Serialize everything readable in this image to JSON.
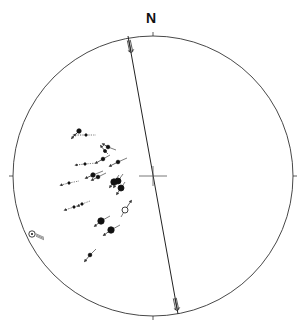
{
  "diagram": {
    "type": "stereonet",
    "north_label": "N",
    "center": [
      153,
      176
    ],
    "radius": 140,
    "colors": {
      "line": "#333333",
      "marker": "#111111",
      "arrow": "#555555",
      "background": "#ffffff"
    },
    "great_circle": {
      "from": [
        128,
        36
      ],
      "to": [
        178,
        314
      ]
    },
    "center_cross": {
      "half_width": 14,
      "half_height": 10
    },
    "fault_sense_markers": [
      {
        "x": 130,
        "y": 46,
        "angle": 78
      },
      {
        "x": 176,
        "y": 304,
        "angle": 78
      }
    ],
    "striae": [
      {
        "x": 79,
        "y": 131,
        "r": 2.2,
        "filled": true,
        "dx": -7,
        "dy": 7,
        "tail": [
          -6,
          6
        ],
        "dotted": false
      },
      {
        "x": 86,
        "y": 135,
        "r": 1.2,
        "filled": true,
        "dx": -12,
        "dy": 0,
        "tail": [
          10,
          0
        ],
        "dotted": true
      },
      {
        "x": 108,
        "y": 147,
        "r": 1.8,
        "filled": true,
        "dx": -5,
        "dy": -3,
        "tail": [
          8,
          3
        ],
        "dotted": false
      },
      {
        "x": 105,
        "y": 151,
        "r": 1.5,
        "filled": true,
        "dx": -4,
        "dy": -5,
        "tail": [
          3,
          3
        ],
        "dotted": false
      },
      {
        "x": 103,
        "y": 159,
        "r": 1.8,
        "filled": true,
        "dx": -7,
        "dy": 4,
        "tail": [
          7,
          -4
        ],
        "dotted": false
      },
      {
        "x": 118,
        "y": 162,
        "r": 1.8,
        "filled": true,
        "dx": -8,
        "dy": 4,
        "tail": [
          9,
          -4
        ],
        "dotted": false
      },
      {
        "x": 85,
        "y": 164,
        "r": 1.2,
        "filled": true,
        "dx": -9,
        "dy": 1,
        "tail": [
          12,
          -1
        ],
        "dotted": true
      },
      {
        "x": 93,
        "y": 175,
        "r": 2.2,
        "filled": true,
        "dx": -7,
        "dy": 3,
        "tail": [
          10,
          -4
        ],
        "dotted": false
      },
      {
        "x": 98,
        "y": 177,
        "r": 1.8,
        "filled": true,
        "dx": -6,
        "dy": 3,
        "tail": [
          8,
          -4
        ],
        "dotted": false
      },
      {
        "x": 114,
        "y": 182,
        "r": 3.2,
        "filled": true,
        "dx": -4,
        "dy": 5,
        "tail": [
          5,
          -7
        ],
        "dotted": false
      },
      {
        "x": 118,
        "y": 181,
        "r": 3.0,
        "filled": true,
        "dx": -4,
        "dy": 6,
        "tail": [
          5,
          -7
        ],
        "dotted": false
      },
      {
        "x": 121,
        "y": 188,
        "r": 3.0,
        "filled": true,
        "dx": -4,
        "dy": 6,
        "tail": [
          4,
          -6
        ],
        "dotted": false
      },
      {
        "x": 69,
        "y": 183,
        "r": 1.2,
        "filled": true,
        "dx": -8,
        "dy": 2,
        "tail": [
          10,
          -2
        ],
        "dotted": true
      },
      {
        "x": 74,
        "y": 207,
        "r": 1.2,
        "filled": true,
        "dx": -9,
        "dy": 3,
        "tail": [
          8,
          -3
        ],
        "dotted": true
      },
      {
        "x": 82,
        "y": 204,
        "r": 1.2,
        "filled": true,
        "dx": -4,
        "dy": 2,
        "tail": [
          8,
          -3
        ],
        "dotted": true
      },
      {
        "x": 125,
        "y": 210,
        "r": 3.0,
        "filled": false,
        "dx": 6,
        "dy": -9,
        "tail": [
          -4,
          7
        ],
        "dotted": false
      },
      {
        "x": 101,
        "y": 221,
        "r": 3.2,
        "filled": true,
        "dx": -6,
        "dy": 5,
        "tail": [
          9,
          -5
        ],
        "dotted": false
      },
      {
        "x": 111,
        "y": 230,
        "r": 3.2,
        "filled": true,
        "dx": -7,
        "dy": 5,
        "tail": [
          9,
          -5
        ],
        "dotted": false
      },
      {
        "x": 90,
        "y": 255,
        "r": 1.8,
        "filled": true,
        "dx": -5,
        "dy": 6,
        "tail": [
          6,
          -6
        ],
        "dotted": false
      }
    ],
    "bullseye_marker": {
      "x": 32,
      "y": 234,
      "r": 3.2,
      "arrow_dx": 8,
      "arrow_dy": 6
    }
  }
}
